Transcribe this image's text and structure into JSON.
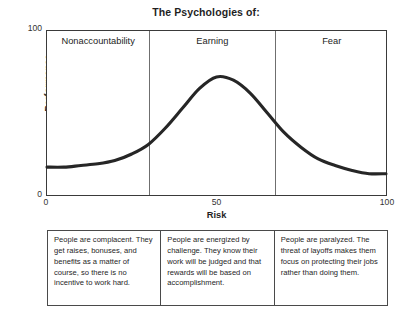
{
  "chart_data": {
    "type": "line",
    "title": "The Psychologies of:",
    "xlabel": "Risk",
    "ylabel": "Performance",
    "xlim": [
      0,
      100
    ],
    "ylim": [
      0,
      100
    ],
    "xticks": [
      "0",
      "50",
      "100"
    ],
    "yticks": [
      "0",
      "100"
    ],
    "grid": false,
    "legend": "none",
    "series": [
      {
        "name": "Performance vs Risk",
        "x": [
          0,
          5,
          10,
          15,
          20,
          25,
          30,
          35,
          40,
          45,
          50,
          55,
          60,
          65,
          70,
          75,
          80,
          85,
          90,
          95,
          100
        ],
        "y": [
          17,
          17,
          18,
          19,
          21,
          25,
          31,
          41,
          53,
          65,
          72,
          70,
          62,
          50,
          38,
          29,
          22,
          18,
          15,
          13,
          13
        ]
      }
    ],
    "zone_boundaries": [
      30,
      67
    ],
    "zones": [
      {
        "label": "Nonaccountability",
        "description": "People are complacent. They get raises, bonuses, and benefits as a matter of course, so there is no incentive to work hard."
      },
      {
        "label": "Earning",
        "description": "People are energized by challenge. They know their work will be judged and that rewards will be based on accomplishment."
      },
      {
        "label": "Fear",
        "description": "People are paralyzed. The threat of layoffs makes them focus on protecting their jobs rather than doing them."
      }
    ],
    "colors": {
      "curve": "#262626",
      "frame": "#3a3a3a",
      "divider": "#6f6f6f",
      "text": "#232323",
      "background": "#ffffff"
    }
  }
}
